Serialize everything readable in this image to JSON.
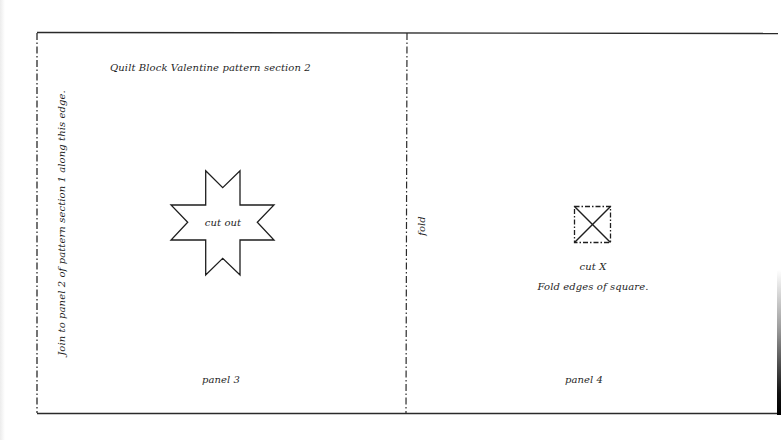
{
  "document": {
    "title": "Quilt Block Valentine pattern section 2",
    "side_instruction": "Join to panel 2 of pattern section 1 along this edge.",
    "fold_label": "fold",
    "panels": [
      {
        "id": "panel-3",
        "label": "panel  3",
        "shape": "eight-point-star",
        "shape_label": "cut out"
      },
      {
        "id": "panel-4",
        "label": "panel 4",
        "shape": "square-with-x",
        "shape_label": "cut X",
        "instruction": "Fold edges of square."
      }
    ]
  },
  "colors": {
    "ink": "#1a1a1a",
    "paper": "#ffffff"
  }
}
